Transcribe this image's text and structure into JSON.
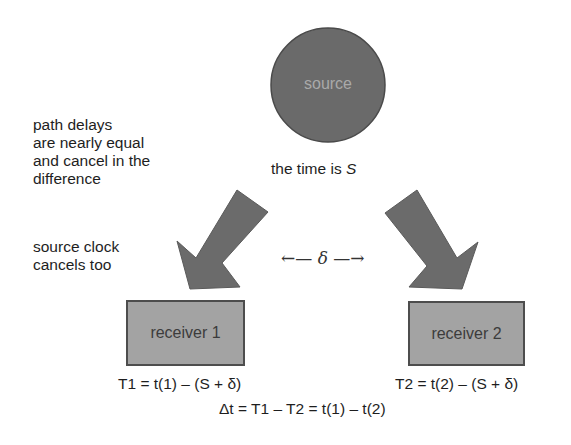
{
  "source": {
    "label": "source",
    "caption_prefix": "the time is ",
    "caption_var": "S"
  },
  "notes": {
    "path_delays": [
      "path delays",
      "are nearly equal",
      "and cancel in the",
      "difference"
    ],
    "source_clock": [
      "source clock",
      "cancels too"
    ]
  },
  "separation": {
    "left_arrow": "←—",
    "symbol": "δ",
    "right_arrow": "—→"
  },
  "receivers": [
    {
      "label": "receiver 1",
      "equation": "T1 = t(1) – (S + δ)"
    },
    {
      "label": "receiver 2",
      "equation": "T2 = t(2) – (S + δ)"
    }
  ],
  "difference_equation": "Δt = T1 – T2 = t(1) – t(2)",
  "colors": {
    "source_fill": "#6a6a6a",
    "arrow_fill": "#6b6b6b",
    "receiver_fill": "#a3a3a3",
    "receiver_border": "#4d4d4d"
  }
}
